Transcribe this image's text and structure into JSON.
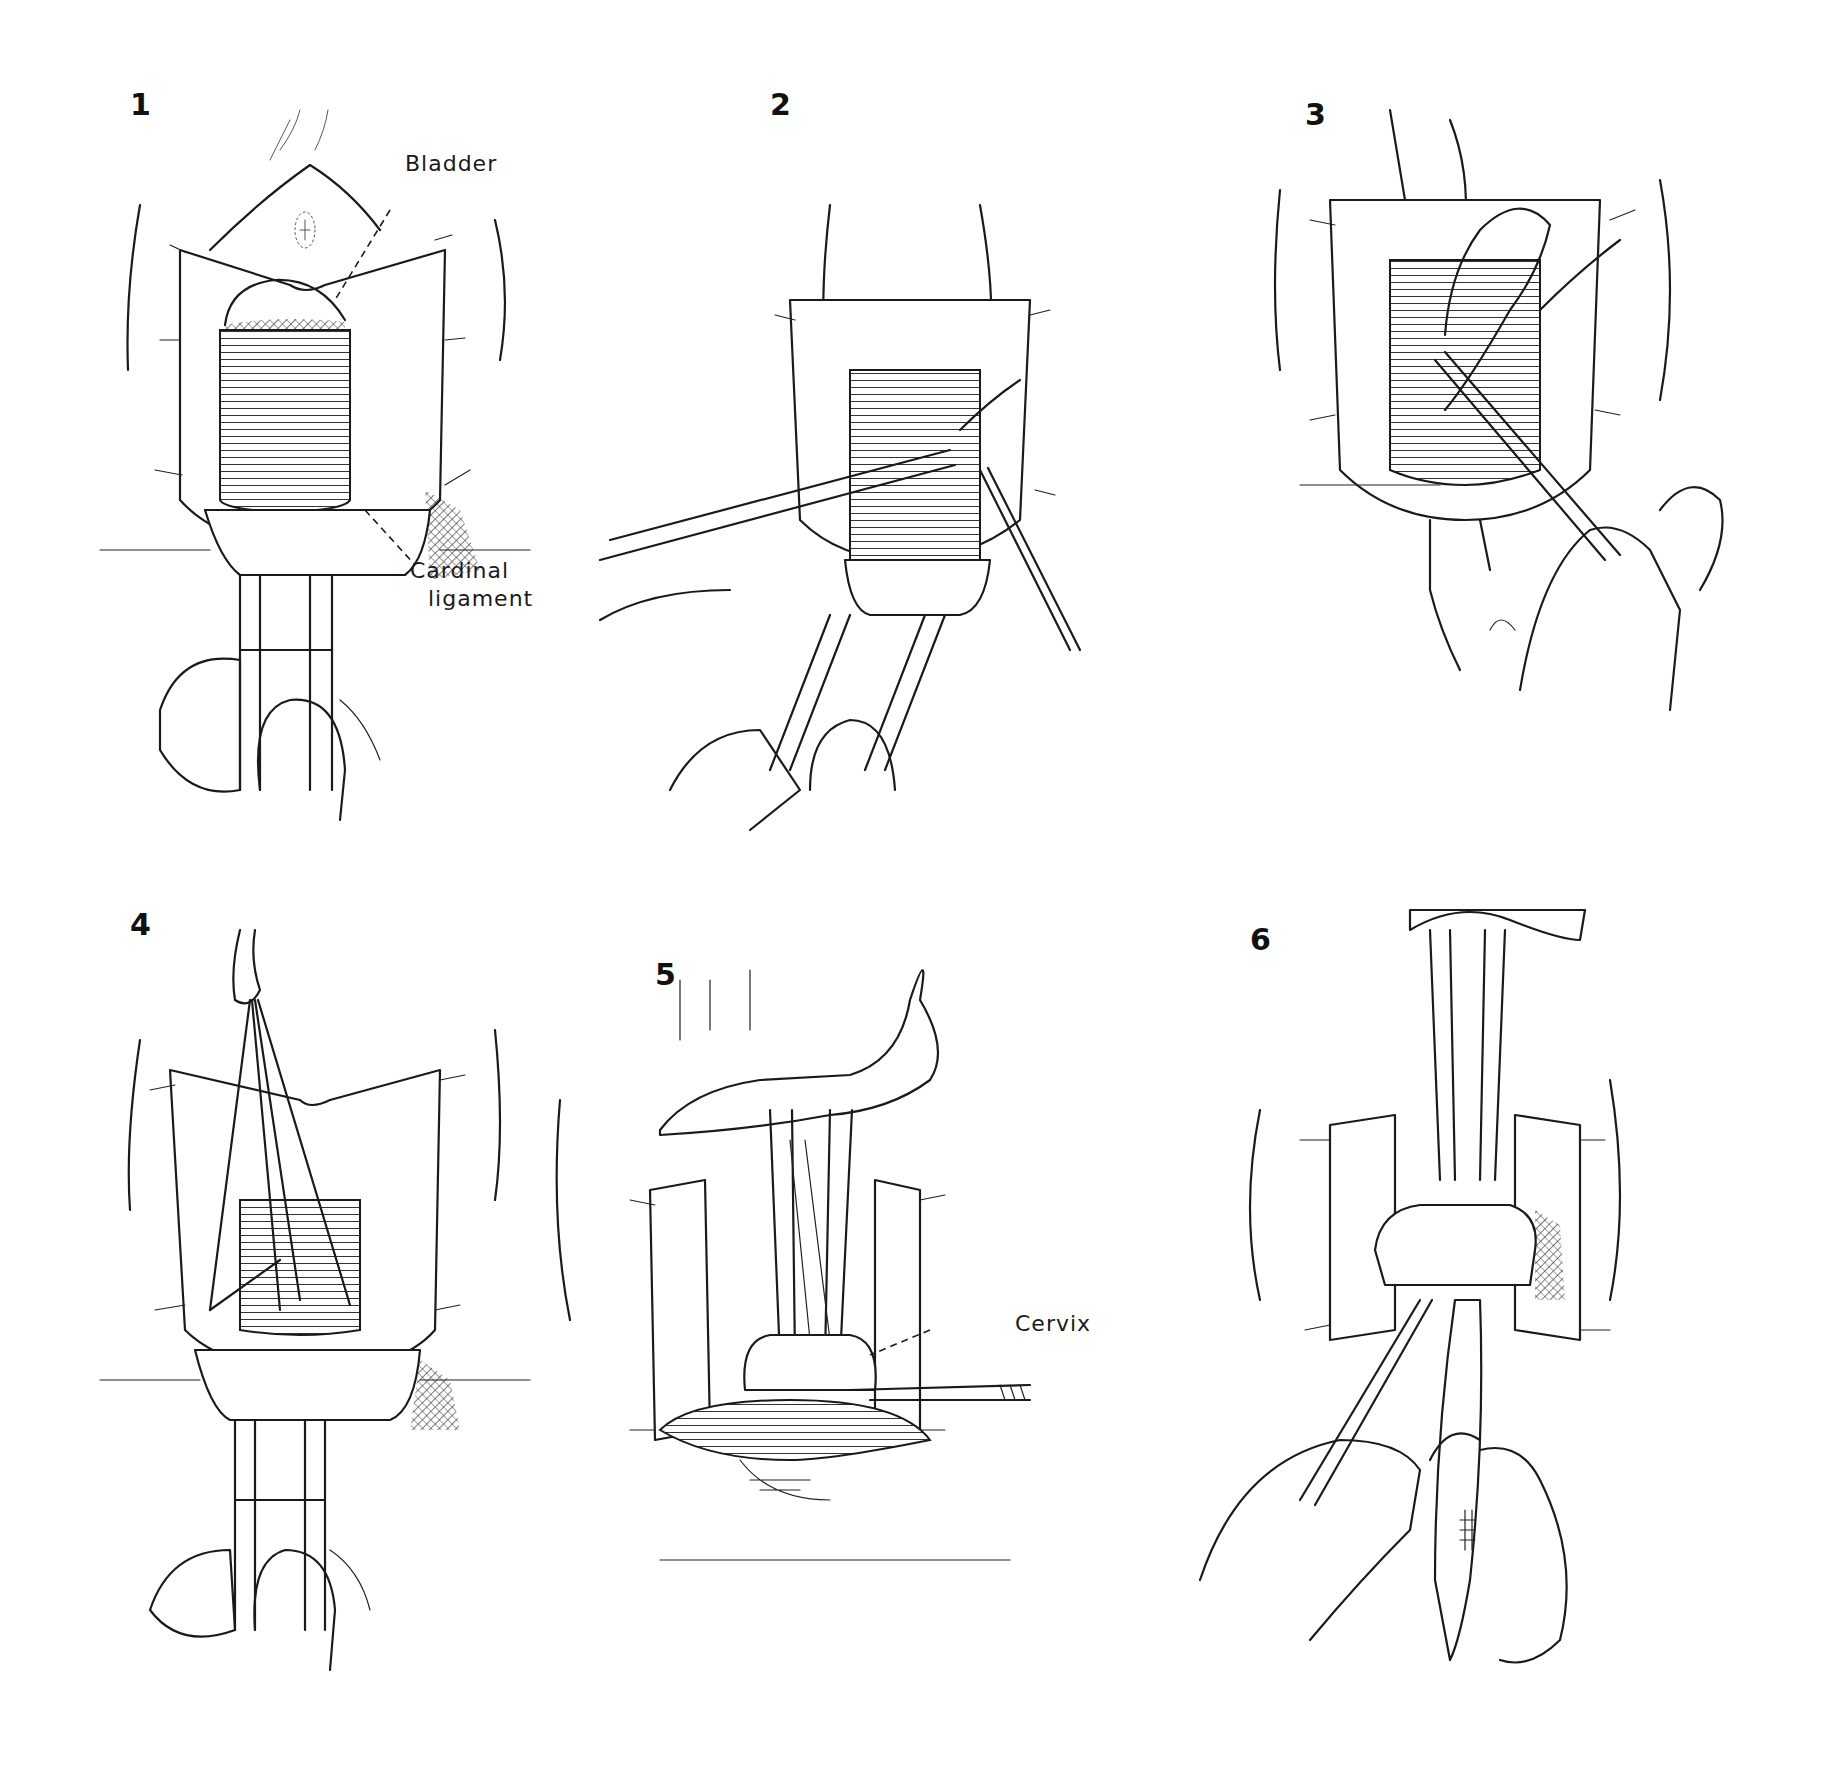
{
  "figure": {
    "panel_count": 6,
    "background_color": "#ffffff",
    "ink_color": "#1a1a1a",
    "panels": [
      {
        "number": "1",
        "labels": [
          {
            "text": "Bladder"
          },
          {
            "text_line1": "Cardinal",
            "text_line2": "ligament"
          }
        ]
      },
      {
        "number": "2",
        "labels": []
      },
      {
        "number": "3",
        "labels": []
      },
      {
        "number": "4",
        "labels": []
      },
      {
        "number": "5",
        "labels": [
          {
            "text": "Cervix"
          }
        ]
      },
      {
        "number": "6",
        "labels": []
      }
    ]
  },
  "labels": {
    "panel1_number": "1",
    "panel2_number": "2",
    "panel3_number": "3",
    "panel4_number": "4",
    "panel5_number": "5",
    "panel6_number": "6",
    "bladder": "Bladder",
    "cardinal_line1": "Cardinal",
    "cardinal_line2": "ligament",
    "cervix": "Cervix"
  }
}
